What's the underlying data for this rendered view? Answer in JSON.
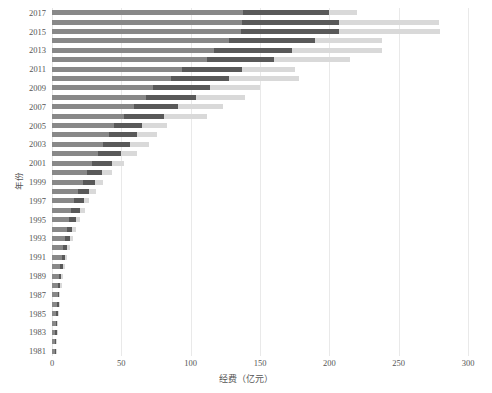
{
  "chart_data": {
    "type": "bar",
    "orientation": "horizontal",
    "stacked": true,
    "title": "",
    "xlabel": "经费（亿元）",
    "ylabel": "年份",
    "xlim": [
      0,
      300
    ],
    "ylim_categories": 37,
    "grid": true,
    "legend": null,
    "xticks": [
      0,
      50,
      100,
      150,
      200,
      250,
      300
    ],
    "xtick_labels": [
      "0",
      "50",
      "100",
      "150",
      "200",
      "250",
      "300"
    ],
    "categories": [
      "2017",
      "2016",
      "2015",
      "2014",
      "2013",
      "2012",
      "2011",
      "2010",
      "2009",
      "2008",
      "2007",
      "2006",
      "2005",
      "2004",
      "2003",
      "2002",
      "2001",
      "2000",
      "1999",
      "1998",
      "1997",
      "1996",
      "1995",
      "1994",
      "1993",
      "1992",
      "1991",
      "1990",
      "1989",
      "1988",
      "1987",
      "1986",
      "1985",
      "1984",
      "1983",
      "1982",
      "1981"
    ],
    "ytick_labels": [
      "2017",
      "2015",
      "2013",
      "2011",
      "2009",
      "2007",
      "2005",
      "2003",
      "2001",
      "1999",
      "1997",
      "1995",
      "1993",
      "1991",
      "1989",
      "1987",
      "1985",
      "1983",
      "1981"
    ],
    "colors": {
      "series_a": "#888888",
      "series_b": "#595959",
      "series_c": "#d9d9d9",
      "grid": "#e9e9e9",
      "text": "#555555",
      "background": "#ffffff"
    },
    "series": [
      {
        "name": "series-a",
        "color": "#888888",
        "values": [
          138,
          137,
          136,
          128,
          117,
          112,
          94,
          86,
          73,
          68,
          59,
          52,
          45,
          41,
          37,
          33,
          29,
          25,
          22,
          19,
          16,
          14,
          12,
          10.5,
          9.5,
          8,
          7,
          6,
          5,
          4.5,
          4,
          3.5,
          3,
          2.8,
          2.5,
          2.2,
          2
        ]
      },
      {
        "name": "series-b",
        "color": "#595959",
        "values": [
          62,
          70,
          71,
          62,
          56,
          48,
          43,
          42,
          41,
          36,
          32,
          29,
          20,
          20,
          19,
          17,
          14,
          11,
          9,
          8,
          7,
          6,
          5,
          4,
          3.5,
          3,
          2.5,
          2,
          1.8,
          1.5,
          1.3,
          1.2,
          1,
          0.9,
          0.8,
          0.7,
          0.6
        ]
      },
      {
        "name": "series-c",
        "color": "#d9d9d9",
        "values": [
          20,
          72,
          73,
          48,
          65,
          55,
          38,
          50,
          36,
          35,
          32,
          31,
          18,
          15,
          14,
          11,
          9,
          7,
          6,
          5,
          4,
          3.5,
          3,
          2.5,
          2,
          1.8,
          1.5,
          1.2,
          1,
          0.9,
          0.8,
          0.7,
          0.6,
          0.5,
          0.5,
          0.4,
          0.4
        ]
      }
    ],
    "totals": [
      220,
      279,
      280,
      238,
      238,
      215,
      175,
      178,
      150,
      139,
      123,
      112,
      83,
      76,
      70,
      61,
      52,
      43,
      37,
      32,
      27,
      23.5,
      20,
      17,
      15,
      12.8,
      11,
      9.2,
      7.8,
      6.9,
      6.1,
      5.4,
      4.6,
      4.2,
      3.8,
      3.3,
      3
    ]
  }
}
